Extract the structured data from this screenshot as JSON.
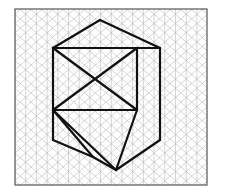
{
  "canvas": {
    "width": 226,
    "height": 195,
    "background": "#ffffff"
  },
  "border": {
    "x": 15,
    "y": 9,
    "width": 192,
    "height": 176,
    "stroke": "#555555",
    "stroke_width": 1.2,
    "fill": "#ffffff"
  },
  "grid": {
    "type": "isometric-triangular",
    "stroke": "#b9b9b9",
    "stroke_width": 0.6,
    "column_spacing": 10.7,
    "row_height": 9.25,
    "origin_x": 15,
    "origin_y": 9,
    "columns": 18,
    "rows": 19,
    "vertical_lines": true,
    "diagonal_up": true,
    "diagonal_down": true
  },
  "figure": {
    "stroke": "#111111",
    "stroke_width": 2.2,
    "fill": "none",
    "vertices": {
      "top": [
        100,
        20
      ],
      "upper_right": [
        160,
        48
      ],
      "upper_left": [
        53,
        48
      ],
      "mid_upper_right": [
        137,
        48
      ],
      "left_mid": [
        53,
        110
      ],
      "right_mid": [
        137,
        110
      ],
      "cross_center": [
        100,
        68
      ],
      "left_lower": [
        53,
        140
      ],
      "right_lower": [
        160,
        140
      ],
      "bottom_left": [
        93,
        157
      ],
      "bottom_right": [
        116,
        170
      ]
    },
    "paths": [
      {
        "name": "outer-hexagon-left-upper",
        "points": "100,20 53,48"
      },
      {
        "name": "outer-hexagon-top-right",
        "points": "100,20 160,48"
      },
      {
        "name": "outer-hexagon-right-vertical",
        "points": "160,48 160,140"
      },
      {
        "name": "outer-hexagon-lower-right",
        "points": "160,140 116,170"
      },
      {
        "name": "outer-hexagon-bottom",
        "points": "116,170 93,157"
      },
      {
        "name": "outer-hexagon-lower-left",
        "points": "93,157 53,140"
      },
      {
        "name": "outer-hexagon-left-vertical",
        "points": "53,140 53,48"
      },
      {
        "name": "inner-top-edge",
        "points": "53,48 137,48"
      },
      {
        "name": "inner-right-vertical",
        "points": "137,48 137,110"
      },
      {
        "name": "inner-cap-right",
        "points": "137,48 160,48"
      },
      {
        "name": "inner-quad-upper-left",
        "points": "53,48 137,110"
      },
      {
        "name": "inner-quad-upper-right",
        "points": "137,48 53,110"
      },
      {
        "name": "inner-quad-horizontal",
        "points": "53,110 137,110"
      },
      {
        "name": "inner-lower-left-diagonal",
        "points": "53,110 116,170"
      },
      {
        "name": "inner-lower-right-diagonal",
        "points": "137,110 116,170"
      },
      {
        "name": "inner-bottom-left-spur",
        "points": "53,110 93,157"
      }
    ]
  },
  "labels": {
    "title": "",
    "caption": ""
  }
}
